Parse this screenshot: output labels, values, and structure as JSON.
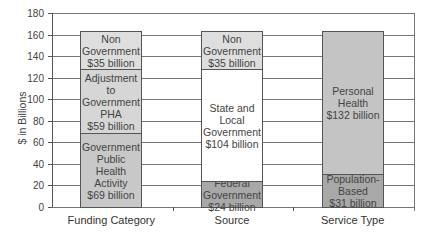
{
  "chart_data": {
    "type": "bar",
    "stacked": true,
    "title": "",
    "xlabel": "",
    "ylabel": "$ in Billions",
    "ylim": [
      0,
      180
    ],
    "yticks": [
      0,
      20,
      40,
      60,
      80,
      100,
      120,
      140,
      160,
      180
    ],
    "grid": true,
    "categories": [
      "Funding Category",
      "Source",
      "Service Type"
    ],
    "stacks": [
      {
        "category": "Funding Category",
        "segments": [
          {
            "label": "Government\nPublic Health\nActivity\n$69 billion",
            "name": "Government Public Health Activity",
            "value": 69,
            "color": "#c8c8c8"
          },
          {
            "label": "Adjustment to\nGovernment\nPHA\n$59 billion",
            "name": "Adjustment to Government PHA",
            "value": 59,
            "color": "#d6d6d6"
          },
          {
            "label": "Non\nGovernment\n$35 billion",
            "name": "Non Government",
            "value": 35,
            "color": "#dedede"
          }
        ]
      },
      {
        "category": "Source",
        "segments": [
          {
            "label": "Federal\nGovernment\n$24 billion",
            "name": "Federal Government",
            "value": 24,
            "color": "#a8a8a8"
          },
          {
            "label": "State and\nLocal\nGovernment\n$104 billion",
            "name": "State and Local Government",
            "value": 104,
            "color": "#ffffff"
          },
          {
            "label": "Non\nGovernment\n$35 billion",
            "name": "Non Government",
            "value": 35,
            "color": "#dedede"
          }
        ]
      },
      {
        "category": "Service Type",
        "segments": [
          {
            "label": "Population-\nBased\n$31 billion",
            "name": "Population-Based",
            "value": 31,
            "color": "#a8a8a8"
          },
          {
            "label": "Personal\nHealth\n$132 billion",
            "name": "Personal Health",
            "value": 132,
            "color": "#c4c4c4"
          }
        ]
      }
    ]
  }
}
